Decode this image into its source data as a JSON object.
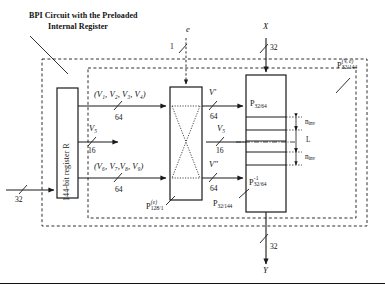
{
  "figure": {
    "title_line1": "BPI Circuit with the Preloaded",
    "title_line2": "Internal Register",
    "background": "#ffffff",
    "line_color": "#1a1a1a"
  },
  "inputs": {
    "data_in_width": "32",
    "enable_label": "e",
    "enable_width": "1",
    "x_label": "X",
    "x_width": "32"
  },
  "outputs": {
    "y_label": "Y",
    "y_width": "32"
  },
  "register": {
    "label": "144-bit register R"
  },
  "buses": {
    "top_group": "(V₁, V₂, V₃, V₄)",
    "top_width": "64",
    "mid_label": "V",
    "mid_sub": "5",
    "mid_width": "16",
    "bottom_group": "(V₆, V₇,V₈, V₉)",
    "bottom_width": "64",
    "vprime_label": "V",
    "vprime_mark": "′",
    "vprime_width": "64",
    "vdprime_label": "V",
    "vdprime_mark": "″",
    "vdprime_width": "64",
    "v5_right_label": "V",
    "v5_right_sub": "5",
    "v5_right_width": "16"
  },
  "blocks": {
    "crossbar": {
      "name": "P",
      "sup": "(e)",
      "sub": "128/1"
    },
    "perm_top": {
      "name": "P",
      "sub": "32/64"
    },
    "perm_bottom": {
      "name": "P",
      "sup": "-1",
      "sub": "32/64"
    },
    "perm_stack": {
      "name": "P",
      "sub": "32/144"
    },
    "outer_box": {
      "name": "P",
      "sup": "(V, e)",
      "sub": "32/144"
    }
  },
  "annotations": {
    "n_inv_top": "n",
    "n_inv_top_sub": "inv",
    "l_label": "L",
    "n_inv_bottom": "n",
    "n_inv_bottom_sub": "inv"
  }
}
